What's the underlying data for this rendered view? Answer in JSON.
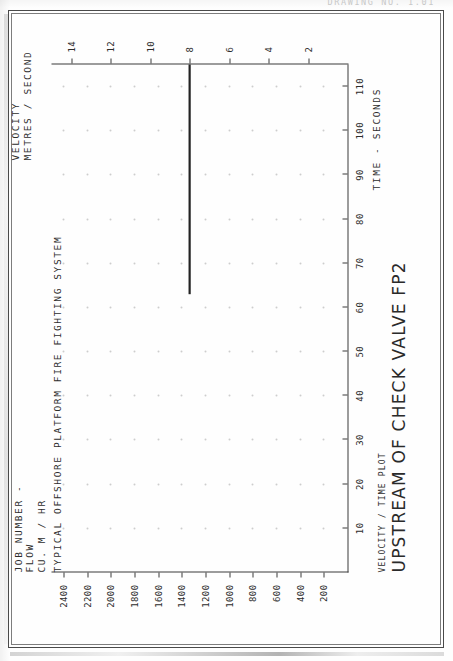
{
  "page": {
    "drawing_no": "DRAWING NO.  1.01"
  },
  "job": {
    "line1": "JOB NUMBER -",
    "line2": "TYPICAL OFFSHORE PLATFORM FIRE FIGHTING SYSTEM"
  },
  "title": {
    "plot_kind": "VELOCITY / TIME PLOT",
    "plot_title": "UPSTREAM OF CHECK VALVE FP2"
  },
  "captions": {
    "flow": "FLOW\nCU. M / HR",
    "velocity": "VELOCITY\nMETRES / SECOND",
    "time": "TIME - SECONDS"
  },
  "chart_data": {
    "type": "line",
    "title": "UPSTREAM OF CHECK VALVE FP2",
    "subtitle": "VELOCITY / TIME PLOT",
    "xlabel": "TIME - SECONDS",
    "ylabel": "FLOW  CU. M / HR",
    "y2label": "VELOCITY  METRES / SECOND",
    "xlim": [
      0,
      115
    ],
    "xticks": [
      10,
      20,
      30,
      40,
      50,
      60,
      70,
      80,
      90,
      100,
      110
    ],
    "xticklabels": [
      "10",
      "20",
      "30",
      "40",
      "50",
      "60",
      "70",
      "80",
      "90",
      "100",
      "110"
    ],
    "ylim": [
      0,
      2500
    ],
    "yticks": [
      200,
      400,
      600,
      800,
      1000,
      1200,
      1400,
      1600,
      1800,
      2000,
      2200,
      2400
    ],
    "yticklabels": [
      "200",
      "400",
      "600",
      "800",
      "1000",
      "1200",
      "1400",
      "1600",
      "1800",
      "2000",
      "2200",
      "2400"
    ],
    "y2lim": [
      0,
      15
    ],
    "y2ticks": [
      2,
      4,
      6,
      8,
      10,
      12,
      14
    ],
    "y2ticklabels": [
      "2",
      "4",
      "6",
      "8",
      "10",
      "12",
      "14"
    ],
    "grid": "dots",
    "legend": "none",
    "series": [
      {
        "name": "Velocity upstream of check valve FP2",
        "axis": "y2",
        "x": [
          0,
          63,
          63,
          115
        ],
        "y": [
          0,
          0,
          8,
          8
        ],
        "comment": "step rise to 8 m/s at t = 63 s, held flat to end of record"
      }
    ]
  }
}
